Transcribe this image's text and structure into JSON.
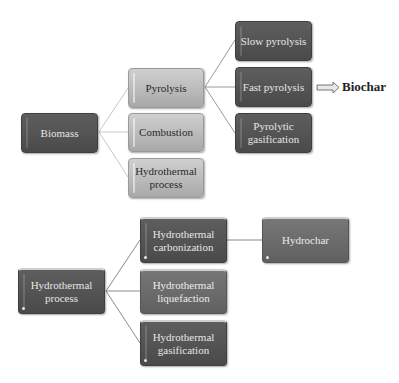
{
  "top_diagram": {
    "root": {
      "label": "Biomass"
    },
    "level1": [
      {
        "label": "Pyrolysis"
      },
      {
        "label": "Combustion"
      },
      {
        "label": "Hydrothermal process"
      }
    ],
    "pyrolysis_children": [
      {
        "label": "Slow pyrolysis"
      },
      {
        "label": "Fast pyrolysis"
      },
      {
        "label": "Pyrolytic gasification"
      }
    ],
    "output": {
      "label": "Biochar",
      "arrow_icon": "double-arrow-right"
    }
  },
  "bottom_diagram": {
    "root": {
      "label": "Hydrothermal process"
    },
    "children": [
      {
        "label": "Hydrothermal carbonization"
      },
      {
        "label": "Hydrothermal liquefaction"
      },
      {
        "label": "Hydrothermal gasification"
      }
    ],
    "output": {
      "label": "Hydrochar"
    }
  },
  "colors": {
    "dark_node": "#555555",
    "medium_node": "#6a6a6a",
    "light_node": "#bbbbbb",
    "connector": "#b0b0b0"
  }
}
